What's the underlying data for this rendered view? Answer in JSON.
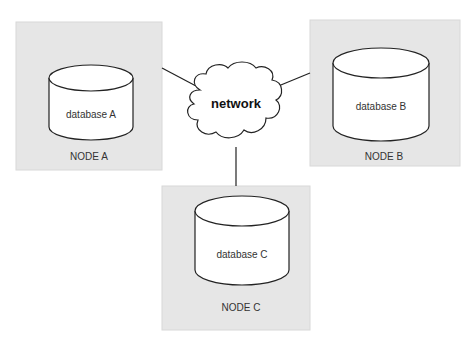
{
  "diagram": {
    "network": {
      "label": "network"
    },
    "nodes": [
      {
        "id": "A",
        "node_label": "NODE A",
        "db_label": "database A"
      },
      {
        "id": "B",
        "node_label": "NODE B",
        "db_label": "database B"
      },
      {
        "id": "C",
        "node_label": "NODE C",
        "db_label": "database C"
      }
    ],
    "colors": {
      "node_fill": "#e6e6e6",
      "db_fill": "#ffffff",
      "stroke": "#222222",
      "background": "#ffffff"
    }
  }
}
